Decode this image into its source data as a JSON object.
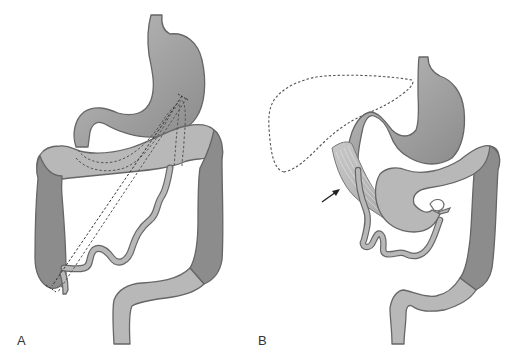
{
  "figure": {
    "panels": [
      {
        "label": "A",
        "structures": [
          "stomach",
          "duodenum",
          "transverse-colon",
          "ascending-colon",
          "descending-colon",
          "sigmoid-colon",
          "small-intestine-loop",
          "terminal-ileum"
        ],
        "overlays": [
          "dashed-bowel-outline",
          "dashed-diagonal-line"
        ]
      },
      {
        "label": "B",
        "structures": [
          "stomach",
          "duodenum",
          "transverse-colon",
          "descending-colon",
          "sigmoid-colon",
          "small-intestine-loop",
          "ligament-band"
        ],
        "overlays": [
          "dashed-liver-outline"
        ],
        "annotations": [
          "arrow-pointing-to-band"
        ]
      }
    ],
    "colors": {
      "light_tissue": "#b8b8b8",
      "medium_tissue": "#a6a6a6",
      "dark_tissue": "#8c8c8c",
      "stomach_gradient_dark": "#8a8a8a",
      "stomach_gradient_light": "#bdbdbd",
      "outline": "#666666",
      "dashed": "#555555",
      "label": "#333333",
      "background": "#ffffff"
    }
  }
}
